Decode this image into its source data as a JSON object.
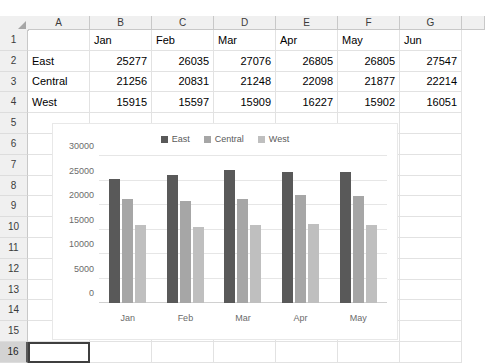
{
  "spreadsheet": {
    "columns": [
      "A",
      "B",
      "C",
      "D",
      "E",
      "F",
      "G"
    ],
    "rows": [
      "1",
      "2",
      "3",
      "4",
      "5",
      "6",
      "7",
      "8",
      "9",
      "10",
      "11",
      "12",
      "13",
      "14",
      "15",
      "16"
    ],
    "selected_row": "16",
    "active_cell": "A16",
    "data": [
      [
        "",
        "Jan",
        "Feb",
        "Mar",
        "Apr",
        "May",
        "Jun"
      ],
      [
        "East",
        "25277",
        "26035",
        "27076",
        "26805",
        "26805",
        "27547"
      ],
      [
        "Central",
        "21256",
        "20831",
        "21248",
        "22098",
        "21877",
        "22214"
      ],
      [
        "West",
        "15915",
        "15597",
        "15909",
        "16227",
        "15902",
        "16051"
      ]
    ]
  },
  "chart_data": {
    "type": "bar",
    "title": "",
    "xlabel": "",
    "ylabel": "",
    "categories": [
      "Jan",
      "Feb",
      "Mar",
      "Apr",
      "May"
    ],
    "series": [
      {
        "name": "East",
        "values": [
          25277,
          26035,
          27076,
          26805,
          26805
        ],
        "color": "#595959"
      },
      {
        "name": "Central",
        "values": [
          21256,
          20831,
          21248,
          22098,
          21877
        ],
        "color": "#a6a6a6"
      },
      {
        "name": "West",
        "values": [
          15915,
          15597,
          15909,
          16227,
          15902
        ],
        "color": "#bfbfbf"
      }
    ],
    "ylim": [
      0,
      30000
    ],
    "yticks": [
      0,
      5000,
      10000,
      15000,
      20000,
      25000,
      30000
    ],
    "ytick_labels": [
      "0",
      "5000",
      "10000",
      "15000",
      "20000",
      "25000",
      "30000"
    ],
    "grid": true,
    "legend_position": "top"
  }
}
